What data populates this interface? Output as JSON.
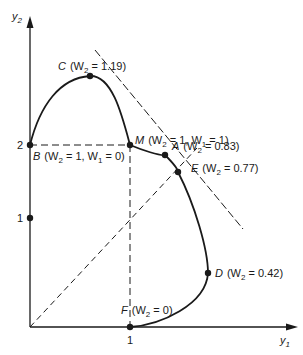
{
  "diagram": {
    "type": "pareto-trade-off-curve",
    "axes": {
      "x_label": "y",
      "x_label_sub": "1",
      "y_label": "y",
      "y_label_sub": "2",
      "x_ticks": [
        {
          "value": "1"
        }
      ],
      "y_ticks": [
        {
          "value": "1"
        },
        {
          "value": "2"
        }
      ]
    },
    "points": [
      {
        "id": "C",
        "name": "C",
        "text": "(W",
        "sub": "2",
        "rest": " = 1.19)"
      },
      {
        "id": "M",
        "name": "M",
        "text": "(W",
        "sub": "2",
        "mid": " = 1, W",
        "sub2": "1",
        "rest": " = 1)"
      },
      {
        "id": "B",
        "name": "B",
        "text": "(W",
        "sub": "2",
        "mid": " = 1, W",
        "sub2": "1",
        "rest": " = 0)"
      },
      {
        "id": "A",
        "name": "A",
        "text": "(W",
        "sub": "2",
        "rest": " = 0.83)"
      },
      {
        "id": "E",
        "name": "E",
        "text": "(W",
        "sub": "2",
        "rest": " = 0.77)"
      },
      {
        "id": "D",
        "name": "D",
        "text": "(W",
        "sub": "2",
        "rest": " = 0.42)"
      },
      {
        "id": "F",
        "name": "F",
        "text": "(W",
        "sub": "2",
        "rest": " = 0)"
      }
    ],
    "colors": {
      "ink": "#1a1a1a",
      "background": "#ffffff"
    }
  }
}
